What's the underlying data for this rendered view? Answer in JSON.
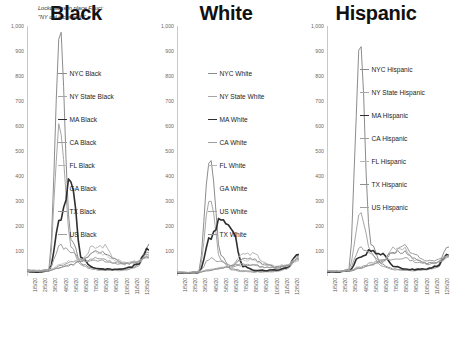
{
  "figure": {
    "panels": [
      "Black",
      "White",
      "Hispanic"
    ],
    "annotation": {
      "line1": "Lockdowns in place Fauci:",
      "line2": "\"NY did it correctly\""
    }
  },
  "chart_data": [
    {
      "type": "line",
      "title": "Black",
      "xlabel": "",
      "ylabel": "",
      "ylim": [
        0,
        1000
      ],
      "yticks": [
        "1,000",
        "900",
        "800",
        "700",
        "600",
        "500",
        "400",
        "300",
        "200",
        "100"
      ],
      "ytick_values": [
        1000,
        900,
        800,
        700,
        600,
        500,
        400,
        300,
        200,
        100
      ],
      "grid": false,
      "legend_position": "inside-right",
      "annotation": "Lockdowns in place Fauci: \"NY did it correctly\"",
      "x": [
        "1/5/20",
        "2/5/20",
        "3/5/20",
        "4/5/20",
        "5/5/20",
        "6/5/20",
        "7/5/20",
        "8/5/20",
        "9/5/20",
        "10/5/20",
        "11/5/20",
        "12/5/20"
      ],
      "series": [
        {
          "name": "NYC Black",
          "color": "#8c8c8c",
          "width": 1.0,
          "values": [
            22,
            20,
            26,
            980,
            150,
            48,
            30,
            26,
            24,
            26,
            40,
            120
          ]
        },
        {
          "name": "NY State Black",
          "color": "#a6a6a6",
          "width": 1.0,
          "values": [
            20,
            18,
            24,
            620,
            110,
            40,
            26,
            22,
            22,
            24,
            34,
            95
          ]
        },
        {
          "name": "MA Black",
          "color": "#2f2f2f",
          "width": 1.6,
          "values": [
            18,
            16,
            20,
            230,
            390,
            70,
            34,
            28,
            26,
            30,
            44,
            105
          ]
        },
        {
          "name": "CA Black",
          "color": "#9e9e9e",
          "width": 1.0,
          "values": [
            24,
            22,
            24,
            40,
            55,
            58,
            70,
            66,
            54,
            50,
            58,
            80
          ]
        },
        {
          "name": "FL Black",
          "color": "#b5b5b5",
          "width": 1.0,
          "values": [
            20,
            20,
            22,
            34,
            46,
            62,
            118,
            120,
            70,
            52,
            56,
            78
          ]
        },
        {
          "name": "GA Black",
          "color": "#c4c4c4",
          "width": 0.9,
          "values": [
            20,
            20,
            24,
            44,
            60,
            66,
            92,
            88,
            62,
            52,
            54,
            72
          ]
        },
        {
          "name": "TX Black",
          "color": "#8f8f8f",
          "width": 1.0,
          "values": [
            18,
            18,
            20,
            32,
            44,
            58,
            96,
            94,
            66,
            50,
            52,
            74
          ]
        },
        {
          "name": "US Black",
          "color": "#a0a0a0",
          "width": 1.0,
          "values": [
            22,
            20,
            26,
            120,
            96,
            62,
            62,
            60,
            50,
            48,
            56,
            90
          ]
        }
      ]
    },
    {
      "type": "line",
      "title": "White",
      "xlabel": "",
      "ylabel": "",
      "ylim": [
        0,
        1000
      ],
      "yticks": [
        "1,000",
        "900",
        "800",
        "700",
        "600",
        "500",
        "400",
        "300",
        "200",
        "100"
      ],
      "ytick_values": [
        1000,
        900,
        800,
        700,
        600,
        500,
        400,
        300,
        200,
        100
      ],
      "grid": false,
      "legend_position": "inside-right",
      "x": [
        "1/5/20",
        "2/5/20",
        "3/5/20",
        "4/5/20",
        "5/5/20",
        "6/5/20",
        "7/5/20",
        "8/5/20",
        "9/5/20",
        "10/5/20",
        "11/5/20",
        "12/5/20"
      ],
      "series": [
        {
          "name": "NYC White",
          "color": "#8c8c8c",
          "width": 1.0,
          "values": [
            14,
            12,
            18,
            490,
            80,
            28,
            20,
            18,
            18,
            20,
            30,
            88
          ]
        },
        {
          "name": "NY State White",
          "color": "#a6a6a6",
          "width": 1.0,
          "values": [
            14,
            12,
            16,
            300,
            62,
            24,
            18,
            16,
            16,
            18,
            26,
            74
          ]
        },
        {
          "name": "MA White",
          "color": "#2f2f2f",
          "width": 1.6,
          "values": [
            12,
            12,
            14,
            150,
            235,
            190,
            40,
            24,
            22,
            24,
            34,
            92
          ]
        },
        {
          "name": "CA White",
          "color": "#9e9e9e",
          "width": 1.0,
          "values": [
            16,
            14,
            16,
            26,
            34,
            36,
            44,
            42,
            34,
            32,
            38,
            62
          ]
        },
        {
          "name": "FL White",
          "color": "#b5b5b5",
          "width": 1.0,
          "values": [
            14,
            14,
            16,
            24,
            30,
            42,
            86,
            88,
            52,
            40,
            44,
            70
          ]
        },
        {
          "name": "GA White",
          "color": "#c4c4c4",
          "width": 0.9,
          "values": [
            14,
            14,
            16,
            26,
            34,
            42,
            66,
            62,
            44,
            36,
            40,
            58
          ]
        },
        {
          "name": "US White",
          "color": "#a0a0a0",
          "width": 1.0,
          "values": [
            16,
            14,
            18,
            70,
            58,
            42,
            46,
            44,
            36,
            34,
            42,
            78
          ]
        },
        {
          "name": "TX White",
          "color": "#8f8f8f",
          "width": 1.0,
          "values": [
            12,
            12,
            14,
            22,
            30,
            40,
            70,
            68,
            46,
            36,
            40,
            66
          ]
        }
      ]
    },
    {
      "type": "line",
      "title": "Hispanic",
      "xlabel": "",
      "ylabel": "",
      "ylim": [
        0,
        1000
      ],
      "yticks": [
        "1,000",
        "900",
        "800",
        "700",
        "600",
        "500",
        "400",
        "300",
        "200",
        "100"
      ],
      "ytick_values": [
        1000,
        900,
        800,
        700,
        600,
        500,
        400,
        300,
        200,
        100
      ],
      "grid": false,
      "legend_position": "inside-right",
      "x": [
        "1/5/20",
        "2/5/20",
        "3/5/20",
        "4/5/20",
        "5/5/20",
        "6/5/20",
        "7/5/20",
        "8/5/20",
        "9/5/20",
        "10/5/20",
        "11/5/20",
        "12/5/20"
      ],
      "series": [
        {
          "name": "NYC Hispanic",
          "color": "#8c8c8c",
          "width": 1.0,
          "values": [
            20,
            18,
            26,
            900,
            130,
            46,
            28,
            24,
            24,
            26,
            38,
            110
          ]
        },
        {
          "name": "NY State Hispanic",
          "color": "#a6a6a6",
          "width": 1.0,
          "values": [
            18,
            18,
            24,
            250,
            96,
            40,
            26,
            22,
            22,
            24,
            34,
            88
          ]
        },
        {
          "name": "MA Hispanic",
          "color": "#2f2f2f",
          "width": 1.6,
          "values": [
            16,
            16,
            20,
            80,
            100,
            90,
            40,
            28,
            26,
            28,
            40,
            86
          ]
        },
        {
          "name": "CA Hispanic",
          "color": "#9e9e9e",
          "width": 1.0,
          "values": [
            20,
            20,
            22,
            36,
            52,
            60,
            90,
            118,
            86,
            62,
            62,
            80
          ]
        },
        {
          "name": "FL Hispanic",
          "color": "#b5b5b5",
          "width": 1.0,
          "values": [
            18,
            18,
            20,
            30,
            42,
            56,
            112,
            110,
            66,
            50,
            52,
            72
          ]
        },
        {
          "name": "TX Hispanic",
          "color": "#8f8f8f",
          "width": 1.0,
          "values": [
            18,
            18,
            20,
            30,
            44,
            58,
            98,
            96,
            68,
            52,
            54,
            76
          ]
        },
        {
          "name": "US Hispanic",
          "color": "#a0a0a0",
          "width": 1.0,
          "values": [
            20,
            18,
            24,
            110,
            88,
            60,
            70,
            72,
            56,
            48,
            54,
            84
          ]
        }
      ]
    }
  ]
}
